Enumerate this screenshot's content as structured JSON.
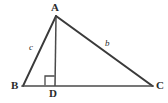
{
  "figure": {
    "kind": "geometry-diagram",
    "background_color": "#ffffff",
    "stroke_color": "#3a3a3a",
    "text_color": "#2b2b2b"
  },
  "vertices": {
    "A": {
      "label": "A",
      "x": 56,
      "y": 16
    },
    "B": {
      "label": "B",
      "x": 23,
      "y": 86
    },
    "C": {
      "label": "C",
      "x": 152,
      "y": 86
    },
    "D": {
      "label": "D",
      "x": 55,
      "y": 86
    }
  },
  "sides": {
    "AB": {
      "label": "c",
      "from": "A",
      "to": "B"
    },
    "AC": {
      "label": "b",
      "from": "A",
      "to": "C"
    },
    "BC": {
      "label": "",
      "from": "B",
      "to": "C"
    },
    "AD": {
      "label": "",
      "from": "A",
      "to": "D"
    }
  },
  "angle_markers": [
    {
      "name": "right-angle-at-D",
      "vertex": "D",
      "type": "square",
      "degrees": 90
    }
  ]
}
